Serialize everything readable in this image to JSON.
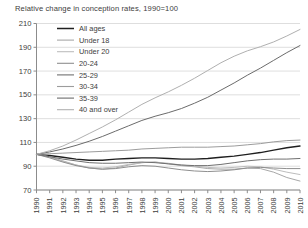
{
  "chart_data": {
    "type": "line",
    "title": "Relative change in conception rates, 1990=100",
    "xlabel": "",
    "ylabel": "",
    "grid": true,
    "legend_position": "top-left",
    "xlim": [
      1990,
      2010
    ],
    "ylim": [
      70,
      210
    ],
    "yticks": [
      70,
      90,
      110,
      130,
      150,
      170,
      190,
      210
    ],
    "x": [
      1990,
      1991,
      1992,
      1993,
      1994,
      1995,
      1996,
      1997,
      1998,
      1999,
      2000,
      2001,
      2002,
      2003,
      2004,
      2005,
      2006,
      2007,
      2008,
      2009,
      2010
    ],
    "series": [
      {
        "name": "All ages",
        "color": "#1f1f1f",
        "values": [
          100,
          99,
          97.5,
          96,
          95,
          95,
          96,
          96.5,
          97,
          97,
          96.5,
          96,
          96,
          96.5,
          97.5,
          98.5,
          100,
          101.5,
          103.5,
          105.5,
          107
        ]
      },
      {
        "name": "Under 18",
        "color": "#a8a8a8",
        "values": [
          100,
          98,
          94.5,
          91,
          88.5,
          87.5,
          88.5,
          91,
          93,
          93.5,
          92,
          90.5,
          89.5,
          88,
          87.5,
          87.5,
          88.5,
          88,
          85,
          80.5,
          77.5
        ]
      },
      {
        "name": "Under 20",
        "color": "#bdbdbd",
        "values": [
          100,
          97.5,
          94,
          91,
          89,
          88.5,
          89.5,
          91.5,
          93,
          93.5,
          92.5,
          91,
          90,
          89,
          88.5,
          89,
          90,
          89.5,
          87.5,
          85,
          83
        ]
      },
      {
        "name": "20-24",
        "color": "#8f8f8f",
        "values": [
          100,
          97,
          93.5,
          90.5,
          88.5,
          87.5,
          88,
          89.5,
          90.5,
          90,
          88.5,
          87,
          86,
          85.5,
          86,
          87,
          88.5,
          89,
          88.5,
          88,
          88
        ]
      },
      {
        "name": "25-29",
        "color": "#707070",
        "values": [
          100,
          98,
          96,
          94.5,
          93,
          92.5,
          92.5,
          93,
          93.5,
          93,
          92,
          91,
          90.5,
          90.5,
          91.5,
          93,
          94.5,
          95.5,
          96,
          96,
          96.5
        ]
      },
      {
        "name": "30-34",
        "color": "#9c9c9c",
        "values": [
          100,
          100.5,
          101,
          101.5,
          102,
          102.5,
          103,
          103.5,
          104.5,
          105,
          105.5,
          106,
          106,
          106,
          106.5,
          107,
          108,
          109,
          110.5,
          111.5,
          112
        ]
      },
      {
        "name": "35-39",
        "color": "#6b6b6b",
        "values": [
          100,
          102,
          104.5,
          107.5,
          111,
          115,
          119.5,
          124,
          128.5,
          132,
          135,
          138.5,
          143,
          148,
          154,
          160,
          166.5,
          172.5,
          179,
          185.5,
          191.5
        ]
      },
      {
        "name": "40 and over",
        "color": "#b0b0b0",
        "values": [
          100,
          103,
          107,
          112,
          117.5,
          123,
          129,
          135.5,
          142,
          147.5,
          152.5,
          158,
          164,
          170.5,
          177,
          182.5,
          187,
          190.5,
          194.5,
          199.5,
          205
        ]
      }
    ]
  },
  "legend": {
    "items": [
      {
        "label": "All ages"
      },
      {
        "label": "Under 18"
      },
      {
        "label": "Under 20"
      },
      {
        "label": "20-24"
      },
      {
        "label": "25-29"
      },
      {
        "label": "30-34"
      },
      {
        "label": "35-39"
      },
      {
        "label": "40 and over"
      }
    ]
  },
  "axes": {
    "y_tick_labels": [
      "210",
      "190",
      "170",
      "150",
      "130",
      "110",
      "90",
      "70"
    ],
    "x_tick_labels": [
      "1990",
      "1991",
      "1992",
      "1993",
      "1994",
      "1995",
      "1996",
      "1997",
      "1998",
      "1999",
      "2000",
      "2001",
      "2002",
      "2003",
      "2004",
      "2005",
      "2006",
      "2007",
      "2008",
      "2009",
      "2010"
    ]
  }
}
